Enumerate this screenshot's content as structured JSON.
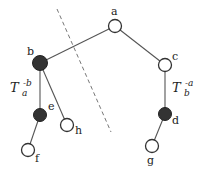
{
  "diagram": {
    "type": "tree",
    "nodes": [
      {
        "id": "a",
        "label": "a",
        "x": 115,
        "y": 26,
        "filled": false
      },
      {
        "id": "b",
        "label": "b",
        "x": 40,
        "y": 63,
        "filled": true
      },
      {
        "id": "c",
        "label": "c",
        "x": 165,
        "y": 65,
        "filled": false
      },
      {
        "id": "e",
        "label": "e",
        "x": 40,
        "y": 115,
        "filled": true
      },
      {
        "id": "h",
        "label": "h",
        "x": 67,
        "y": 125,
        "filled": false
      },
      {
        "id": "f",
        "label": "f",
        "x": 28,
        "y": 150,
        "filled": false
      },
      {
        "id": "d",
        "label": "d",
        "x": 165,
        "y": 114,
        "filled": true
      },
      {
        "id": "g",
        "label": "g",
        "x": 152,
        "y": 146,
        "filled": false
      }
    ],
    "edges": [
      [
        "a",
        "b"
      ],
      [
        "a",
        "c"
      ],
      [
        "b",
        "e"
      ],
      [
        "b",
        "h"
      ],
      [
        "e",
        "f"
      ],
      [
        "c",
        "d"
      ],
      [
        "d",
        "g"
      ]
    ],
    "cut_line": {
      "x1": 57,
      "y1": 9,
      "x2": 111,
      "y2": 132,
      "style": "dashed"
    },
    "subtree_labels": {
      "left": {
        "base": "T",
        "sub": "a",
        "sup": "-b"
      },
      "right": {
        "base": "T",
        "sub": "b",
        "sup": "-a"
      }
    }
  }
}
